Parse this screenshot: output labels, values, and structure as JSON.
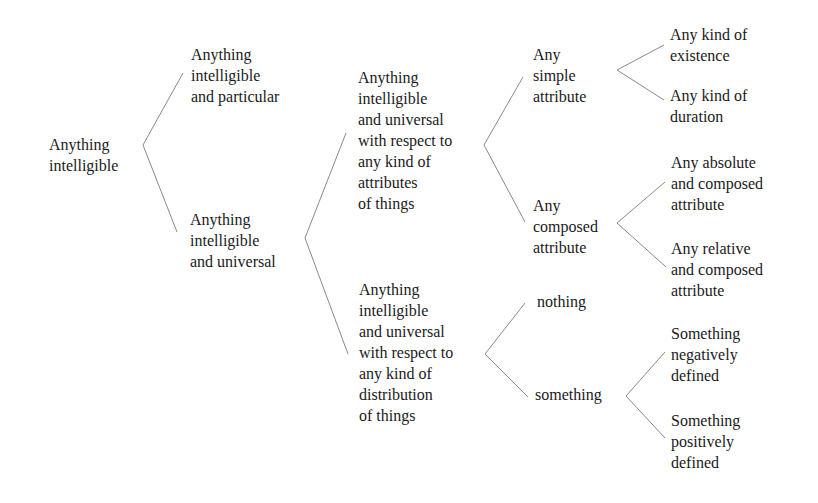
{
  "diagram": {
    "type": "tree",
    "nodes": {
      "root": "Anything\nintelligible",
      "particular": "Anything\nintelligible\nand particular",
      "universal": "Anything\nintelligible\nand universal",
      "attributes": "Anything\nintelligible\nand universal\nwith respect to\nany kind of\nattributes\nof things",
      "distribution": "Anything\nintelligible\nand universal\nwith respect to\nany kind of\ndistribution\nof things",
      "simple_attribute": "Any\nsimple\nattribute",
      "composed_attribute": "Any\ncomposed\nattribute",
      "existence": "Any kind of\nexistence",
      "duration": "Any kind of\nduration",
      "absolute_composed": "Any absolute\nand composed\nattribute",
      "relative_composed": "Any relative\nand composed\nattribute",
      "nothing": "nothing",
      "something": "something",
      "negatively_defined": "Something\nnegatively\ndefined",
      "positively_defined": "Something\npositively\ndefined"
    },
    "edges": [
      [
        "root",
        "particular"
      ],
      [
        "root",
        "universal"
      ],
      [
        "universal",
        "attributes"
      ],
      [
        "universal",
        "distribution"
      ],
      [
        "attributes",
        "simple_attribute"
      ],
      [
        "attributes",
        "composed_attribute"
      ],
      [
        "simple_attribute",
        "existence"
      ],
      [
        "simple_attribute",
        "duration"
      ],
      [
        "composed_attribute",
        "absolute_composed"
      ],
      [
        "composed_attribute",
        "relative_composed"
      ],
      [
        "distribution",
        "nothing"
      ],
      [
        "distribution",
        "something"
      ],
      [
        "something",
        "negatively_defined"
      ],
      [
        "something",
        "positively_defined"
      ]
    ],
    "colors": {
      "text": "#1a1a1a",
      "lines": "#8a8a8a",
      "background": "#ffffff"
    }
  }
}
